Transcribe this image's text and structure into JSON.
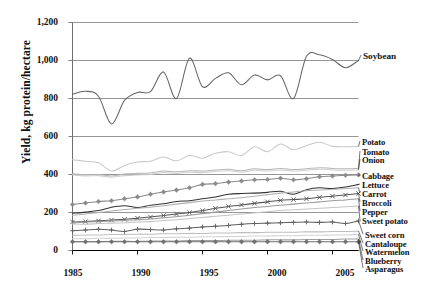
{
  "chart_data": {
    "type": "line",
    "title": "",
    "xlabel": "",
    "ylabel": "Yield, kg protein/hectare",
    "xlim": [
      1985,
      2007
    ],
    "ylim": [
      0,
      1200
    ],
    "ytick_labels": [
      "0",
      "200",
      "400",
      "600",
      "800",
      "1,000",
      "1,200"
    ],
    "ytick_values": [
      0,
      200,
      400,
      600,
      800,
      1000,
      1200
    ],
    "xtick_labels": [
      "1985",
      "1990",
      "1995",
      "2000",
      "2005"
    ],
    "xtick_values": [
      1985,
      1990,
      1995,
      2000,
      2005
    ],
    "grid": "horizontal-major",
    "legend_position": "right-inline-labels",
    "x": [
      1985,
      1986,
      1987,
      1988,
      1989,
      1990,
      1991,
      1992,
      1993,
      1994,
      1995,
      1996,
      1997,
      1998,
      1999,
      2000,
      2001,
      2002,
      2003,
      2004,
      2005,
      2006,
      2007
    ],
    "series": [
      {
        "name": "Soybean",
        "color": "#666666",
        "marker": "none",
        "values": [
          822,
          838,
          812,
          666,
          790,
          832,
          836,
          940,
          800,
          1012,
          862,
          906,
          935,
          872,
          924,
          898,
          920,
          800,
          1022,
          1030,
          1005,
          962,
          1000
        ]
      },
      {
        "name": "Potato",
        "color": "#c9c9c9",
        "marker": "none",
        "values": [
          478,
          470,
          462,
          418,
          448,
          466,
          470,
          492,
          472,
          500,
          486,
          512,
          520,
          500,
          546,
          520,
          560,
          530,
          552,
          570,
          548,
          546,
          548
        ]
      },
      {
        "name": "Tomato",
        "color": "#b5b5b5",
        "marker": "none",
        "values": [
          404,
          398,
          400,
          392,
          402,
          406,
          408,
          418,
          414,
          420,
          418,
          424,
          428,
          420,
          430,
          426,
          432,
          426,
          430,
          436,
          432,
          430,
          432
        ]
      },
      {
        "name": "Onion",
        "color": "#cfcfcf",
        "marker": "none",
        "values": [
          398,
          392,
          394,
          386,
          394,
          398,
          400,
          410,
          406,
          412,
          410,
          416,
          420,
          412,
          422,
          418,
          424,
          418,
          422,
          428,
          424,
          422,
          424
        ]
      },
      {
        "name": "Cabbage",
        "color": "#8a8a8a",
        "marker": "diamond",
        "values": [
          242,
          250,
          258,
          262,
          272,
          282,
          296,
          308,
          318,
          330,
          348,
          352,
          360,
          366,
          372,
          374,
          380,
          372,
          378,
          388,
          392,
          396,
          398
        ]
      },
      {
        "name": "Lettuce",
        "color": "#333333",
        "marker": "none",
        "values": [
          196,
          202,
          210,
          228,
          236,
          226,
          238,
          246,
          258,
          262,
          272,
          282,
          296,
          300,
          302,
          306,
          312,
          296,
          320,
          330,
          326,
          334,
          348
        ]
      },
      {
        "name": "Carrot",
        "color": "#b0b0b0",
        "marker": "none",
        "values": [
          186,
          192,
          200,
          208,
          216,
          222,
          228,
          236,
          244,
          252,
          260,
          266,
          272,
          278,
          286,
          294,
          302,
          308,
          314,
          318,
          322,
          326,
          330
        ]
      },
      {
        "name": "Broccoli",
        "color": "#555555",
        "marker": "cross",
        "values": [
          150,
          152,
          156,
          160,
          164,
          170,
          176,
          184,
          192,
          200,
          210,
          222,
          232,
          240,
          248,
          256,
          264,
          268,
          272,
          280,
          286,
          292,
          300
        ]
      },
      {
        "name": "Pepper",
        "color": "#9a9a9a",
        "marker": "none",
        "values": [
          146,
          150,
          152,
          156,
          158,
          162,
          166,
          172,
          178,
          186,
          194,
          202,
          210,
          218,
          226,
          232,
          238,
          244,
          250,
          256,
          262,
          266,
          272
        ]
      },
      {
        "name": "Sweet potato",
        "color": "#c4c4c4",
        "marker": "none",
        "values": [
          140,
          138,
          142,
          144,
          146,
          150,
          152,
          158,
          162,
          168,
          174,
          180,
          186,
          192,
          198,
          204,
          210,
          214,
          218,
          222,
          226,
          230,
          234
        ]
      },
      {
        "name": "Sweet corn",
        "color": "#606060",
        "marker": "plus",
        "values": [
          104,
          108,
          112,
          108,
          100,
          112,
          110,
          108,
          114,
          118,
          124,
          128,
          132,
          138,
          142,
          144,
          146,
          148,
          150,
          148,
          150,
          142,
          156
        ]
      },
      {
        "name": "Cantaloupe",
        "color": "#bdbdbd",
        "marker": "none",
        "values": [
          80,
          82,
          82,
          84,
          84,
          86,
          86,
          88,
          88,
          90,
          90,
          92,
          92,
          94,
          94,
          96,
          96,
          96,
          98,
          98,
          100,
          100,
          102
        ]
      },
      {
        "name": "Watermelon",
        "color": "#d2d2d2",
        "marker": "none",
        "values": [
          62,
          62,
          64,
          64,
          66,
          66,
          68,
          68,
          70,
          70,
          72,
          72,
          74,
          74,
          76,
          76,
          78,
          78,
          80,
          80,
          82,
          82,
          84
        ]
      },
      {
        "name": "Blueberry",
        "color": "#9e9e9e",
        "marker": "none",
        "values": [
          46,
          46,
          46,
          48,
          48,
          48,
          50,
          50,
          50,
          52,
          52,
          52,
          54,
          54,
          54,
          56,
          56,
          56,
          58,
          58,
          58,
          60,
          60
        ]
      },
      {
        "name": "Asparagus",
        "color": "#707070",
        "marker": "diamond",
        "values": [
          46,
          46,
          46,
          46,
          46,
          46,
          46,
          46,
          46,
          46,
          46,
          46,
          46,
          46,
          46,
          46,
          46,
          46,
          46,
          46,
          46,
          46,
          46
        ]
      }
    ],
    "annotations": [
      {
        "text": "Soybean",
        "x": 2007,
        "y": 1000
      },
      {
        "text": "Potato",
        "x": 2007,
        "y": 548
      },
      {
        "text": "Tomato",
        "x": 2007,
        "y": 432
      },
      {
        "text": "Onion",
        "x": 2007,
        "y": 424
      },
      {
        "text": "Cabbage",
        "x": 2007,
        "y": 398
      },
      {
        "text": "Lettuce",
        "x": 2007,
        "y": 348
      },
      {
        "text": "Carrot",
        "x": 2007,
        "y": 330
      },
      {
        "text": "Broccoli",
        "x": 2007,
        "y": 300
      },
      {
        "text": "Pepper",
        "x": 2007,
        "y": 272
      },
      {
        "text": "Sweet potato",
        "x": 2007,
        "y": 234
      },
      {
        "text": "Sweet corn",
        "x": 2007,
        "y": 156
      },
      {
        "text": "Cantaloupe",
        "x": 2007,
        "y": 102
      },
      {
        "text": "Watermelon",
        "x": 2007,
        "y": 84
      },
      {
        "text": "Blueberry",
        "x": 2007,
        "y": 60
      },
      {
        "text": "Asparagus",
        "x": 2007,
        "y": 46
      }
    ]
  },
  "axis": {
    "y_title": "Yield, kg protein/hectare"
  },
  "labels": {
    "soybean": "Soybean",
    "potato": "Potato",
    "tomato": "Tomato",
    "onion": "Onion",
    "cabbage": "Cabbage",
    "lettuce": "Lettuce",
    "carrot": "Carrot",
    "broccoli": "Broccoli",
    "pepper": "Pepper",
    "sweet_potato": "Sweet potato",
    "sweet_corn": "Sweet corn",
    "cantaloupe": "Cantaloupe",
    "watermelon": "Watermelon",
    "blueberry": "Blueberry",
    "asparagus": "Asparagus"
  },
  "yticks": {
    "t0": "0",
    "t200": "200",
    "t400": "400",
    "t600": "600",
    "t800": "800",
    "t1000": "1,000",
    "t1200": "1,200"
  },
  "xticks": {
    "t1985": "1985",
    "t1990": "1990",
    "t1995": "1995",
    "t2000": "2000",
    "t2005": "2005"
  }
}
